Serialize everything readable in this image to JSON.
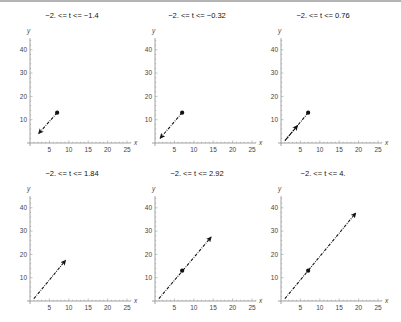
{
  "chart_data": [
    {
      "type": "line",
      "title": "−2. <= t <= −1.4",
      "xlabel": "x",
      "ylabel": "y",
      "xlim": [
        0,
        26
      ],
      "ylim": [
        0,
        45
      ],
      "xticks": [
        5,
        10,
        15,
        20,
        25
      ],
      "yticks": [
        10,
        20,
        30,
        40
      ],
      "point": [
        7,
        13
      ],
      "segment": {
        "from": [
          7,
          13
        ],
        "to": [
          2.2,
          4
        ],
        "style": "dot-dash",
        "arrowhead": "end"
      }
    },
    {
      "type": "line",
      "title": "−2. <= t <= −0.32",
      "xlabel": "x",
      "ylabel": "y",
      "xlim": [
        0,
        26
      ],
      "ylim": [
        0,
        45
      ],
      "xticks": [
        5,
        10,
        15,
        20,
        25
      ],
      "yticks": [
        10,
        20,
        30,
        40
      ],
      "point": [
        7,
        13
      ],
      "segment": {
        "from": [
          7,
          13
        ],
        "to": [
          1.3,
          2
        ],
        "style": "dot-dash",
        "arrowhead": "end"
      }
    },
    {
      "type": "line",
      "title": "−2. <= t <= 0.76",
      "xlabel": "x",
      "ylabel": "y",
      "xlim": [
        0,
        26
      ],
      "ylim": [
        0,
        45
      ],
      "xticks": [
        5,
        10,
        15,
        20,
        25
      ],
      "yticks": [
        10,
        20,
        30,
        40
      ],
      "point": [
        7,
        13
      ],
      "segment": {
        "from": [
          7,
          13
        ],
        "to": [
          1,
          1
        ],
        "style": "dot-dash",
        "arrowhead": "none"
      },
      "segment2": {
        "from": [
          1,
          1
        ],
        "to": [
          4.3,
          7.5
        ],
        "style": "dot-dash",
        "arrowhead": "end"
      }
    },
    {
      "type": "line",
      "title": "−2. <= t <= 1.84",
      "xlabel": "x",
      "ylabel": "y",
      "xlim": [
        0,
        26
      ],
      "ylim": [
        0,
        45
      ],
      "xticks": [
        5,
        10,
        15,
        20,
        25
      ],
      "yticks": [
        10,
        20,
        30,
        40
      ],
      "point": null,
      "segment": {
        "from": [
          1,
          1
        ],
        "to": [
          9.2,
          17.5
        ],
        "style": "dot-dash",
        "arrowhead": "end"
      }
    },
    {
      "type": "line",
      "title": "−2. <= t <= 2.92",
      "xlabel": "x",
      "ylabel": "y",
      "xlim": [
        0,
        26
      ],
      "ylim": [
        0,
        45
      ],
      "xticks": [
        5,
        10,
        15,
        20,
        25
      ],
      "yticks": [
        10,
        20,
        30,
        40
      ],
      "point": [
        7,
        13
      ],
      "segment": {
        "from": [
          1,
          1
        ],
        "to": [
          14.5,
          27.5
        ],
        "style": "dot-dash",
        "arrowhead": "end"
      }
    },
    {
      "type": "line",
      "title": "−2. <= t <= 4.",
      "xlabel": "x",
      "ylabel": "y",
      "xlim": [
        0,
        26
      ],
      "ylim": [
        0,
        45
      ],
      "xticks": [
        5,
        10,
        15,
        20,
        25
      ],
      "yticks": [
        10,
        20,
        30,
        40
      ],
      "point": [
        7,
        13
      ],
      "segment": {
        "from": [
          1,
          1
        ],
        "to": [
          19.3,
          37.8
        ],
        "style": "dot-dash",
        "arrowhead": "end"
      }
    }
  ],
  "layout": {
    "origins": [
      [
        30,
        143
      ],
      [
        155,
        143
      ],
      [
        281,
        143
      ],
      [
        30,
        301
      ],
      [
        155,
        301
      ],
      [
        281,
        301
      ]
    ],
    "px_per_x": 3.88,
    "px_per_y": 2.33,
    "colors": {
      "axis": "#8a8a8a",
      "series": "#111111",
      "tick_text": "#444444"
    }
  }
}
